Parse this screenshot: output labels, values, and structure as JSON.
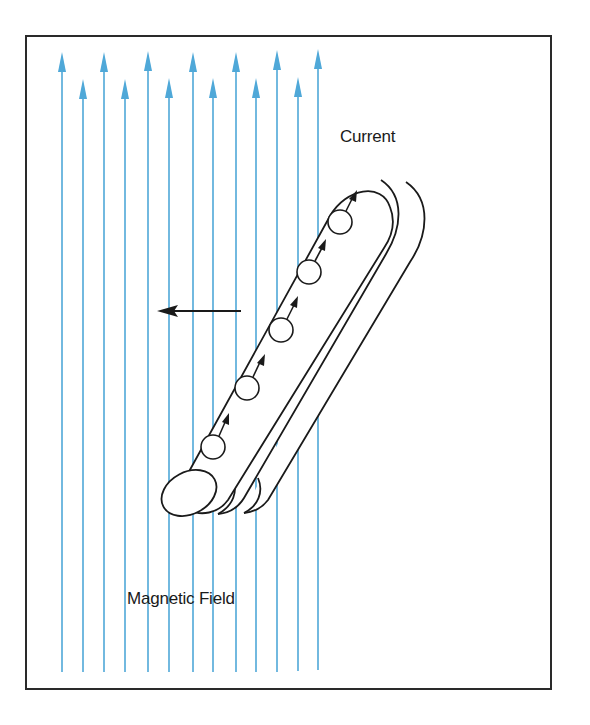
{
  "diagram": {
    "labels": {
      "current": "Current",
      "magnetic_field": "Magnetic Field"
    },
    "colors": {
      "field_lines": "#4fa8d8",
      "ink": "#1a1a1a",
      "frame": "#2a2a2a",
      "background": "#ffffff"
    },
    "field_lines": {
      "count": 13,
      "x_positions": [
        62,
        83,
        104,
        125,
        148,
        169,
        193,
        213,
        236,
        256,
        277,
        298,
        318
      ],
      "tall_tip_y": 52,
      "short_tip_y": 80,
      "bottom_y": 672,
      "direction": "up"
    },
    "force_arrow": {
      "direction": "left",
      "from": [
        241,
        311
      ],
      "to": [
        157,
        311
      ]
    },
    "conductor": {
      "shape": "tilted cylinder with two trailing motion outlines",
      "charge_carriers": 5,
      "carrier_direction": "along conductor toward upper right"
    }
  }
}
